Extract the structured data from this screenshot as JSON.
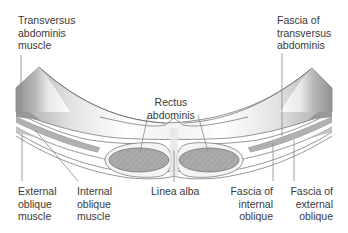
{
  "diagram": {
    "colors": {
      "outline": "#6a6a6a",
      "muscle_fill_dark": "#9c9c9c",
      "muscle_fill_light": "#f2f2f2",
      "rectus_fill": "#a8a8a8",
      "leader_line": "#8a8a8a",
      "text": "#3a3a3a"
    },
    "labels": {
      "transversus_abdominis_muscle": [
        "Transversus",
        "abdominis",
        "muscle"
      ],
      "rectus_abdominis": [
        "Rectus",
        "abdominis"
      ],
      "fascia_of_transversus_abdominis": [
        "Fascia of",
        "transversus",
        "abdominis"
      ],
      "external_oblique_muscle": [
        "External",
        "oblique",
        "muscle"
      ],
      "internal_oblique_muscle": [
        "Internal",
        "oblique",
        "muscle"
      ],
      "linea_alba": [
        "Linea alba"
      ],
      "fascia_of_internal_oblique": [
        "Fascia of",
        "internal",
        "oblique"
      ],
      "fascia_of_external_oblique": [
        "Fascia of",
        "external",
        "oblique"
      ]
    }
  }
}
